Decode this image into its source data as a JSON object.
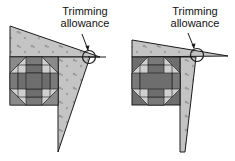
{
  "figures": [
    {
      "id": "left",
      "label_line1": "Trimming",
      "label_line2": "allowance"
    },
    {
      "id": "right",
      "label_line1": "Trimming",
      "label_line2": "allowance"
    }
  ],
  "colors": {
    "fabric_light": "#c2c2c2",
    "block_dark": "#6e6e6e",
    "block_mid": "#8c8c8c",
    "block_light": "#cfcfcf",
    "outline": "#1a1a1a"
  }
}
